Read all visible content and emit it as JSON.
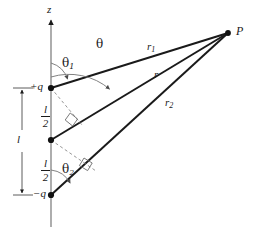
{
  "figure": {
    "kind": "physics-diagram",
    "background_color": "#ffffff",
    "stroke_color": "#1a1a1a",
    "thin_stroke_color": "#6b6b6b",
    "dashed_stroke_color": "#8a8a8a"
  },
  "labels": {
    "axis_z": "z",
    "point_p": "P",
    "charge_positive": "+q",
    "charge_negative": "−q",
    "length_l": "l",
    "half_length_num": "l",
    "half_length_den": "2",
    "r_main": "r",
    "r_one": "r",
    "r_one_sub": "1",
    "r_two": "r",
    "r_two_sub": "2",
    "theta": "θ",
    "theta_one": "θ",
    "theta_one_sub": "1",
    "theta_two": "θ",
    "theta_two_sub": "2"
  },
  "geometry": {
    "axis_x": 51,
    "axis_top_y": 18,
    "axis_bottom_y": 227,
    "charge_positive_y": 88,
    "origin_y": 140,
    "charge_negative_y": 195,
    "point_p_x": 228,
    "point_p_y": 33,
    "dimension_line_x": 22,
    "angle_theta_radius": 63,
    "angle_theta_one_radius": 25,
    "angle_theta_two_radius": 25
  },
  "icon_names": {
    "axis_arrow": "arrow-up-icon",
    "dimension_arrow_top": "arrow-up-icon",
    "dimension_arrow_bottom": "arrow-down-icon",
    "angle_arrow": "arc-arrow-icon",
    "right_angle": "right-angle-marker-icon",
    "charge_dot": "point-marker-icon"
  }
}
